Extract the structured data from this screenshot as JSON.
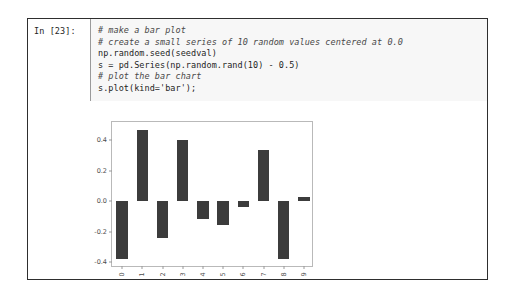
{
  "cell": {
    "prompt_label": "In [23]:",
    "code_lines": [
      {
        "text": "# make a bar plot",
        "style": "comment"
      },
      {
        "text": "# create a small series of 10 random values centered at 0.0",
        "style": "comment"
      },
      {
        "text": "np.random.seed(seedval)",
        "style": "code"
      },
      {
        "text": "s = pd.Series(np.random.rand(10) - 0.5)",
        "style": "code"
      },
      {
        "text": "# plot the bar chart",
        "style": "comment"
      },
      {
        "text": "s.plot(kind='bar');",
        "style": "code"
      }
    ]
  },
  "chart_data": {
    "type": "bar",
    "title": "",
    "xlabel": "",
    "ylabel": "",
    "categories": [
      "0",
      "1",
      "2",
      "3",
      "4",
      "5",
      "6",
      "7",
      "8",
      "9"
    ],
    "values": [
      -0.38,
      0.47,
      -0.24,
      0.4,
      -0.12,
      -0.16,
      -0.04,
      0.335,
      -0.38,
      0.03
    ],
    "ylim": [
      -0.44,
      0.52
    ],
    "yticks": [
      0.4,
      0.2,
      0.0,
      -0.2,
      -0.4
    ],
    "ytick_labels": [
      "0.4",
      "0.2",
      "0.0",
      "-0.2",
      "-0.4"
    ],
    "grid": false,
    "legend": false,
    "bar_color": "#3c3c3c"
  }
}
